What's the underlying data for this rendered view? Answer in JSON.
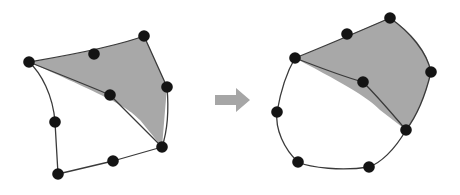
{
  "figure": {
    "title": "Mesh refinement transformation",
    "background_color": "#ffffff",
    "width": 460,
    "height": 195
  },
  "colors": {
    "node_fill": "#141414",
    "edge_stroke": "#3a3a3a",
    "shaded_region_fill": "#a8a8a8",
    "unshaded_region_fill": "#ffffff",
    "arrow_fill": "#a6a6a6"
  },
  "style": {
    "node_radius": 5.8,
    "edge_width": 1.3
  },
  "arrow": {
    "name": "transformation-arrow",
    "direction": "right",
    "path": "M 215 95 L 236 95 L 236 88 L 250 100 L 236 112 L 236 105 L 215 105 Z"
  },
  "panels": [
    {
      "id": "before",
      "label": "before",
      "shaded_region": {
        "label": "shaded-region",
        "fill_path": "M 29 62 C 60 57 110 48 144 36 L 167 87 L 162 147 L 140 120 C 126 106 112 99 29 62 Z"
      },
      "unshaded_region": {
        "label": "unshaded-region",
        "fill_path": "M 29 62 C 70 78 95 88 110 95 L 162 147 L 58 174 L 55 122 C 52 95 40 74 29 62 Z"
      },
      "edges": [
        {
          "name": "edge-top-left",
          "path": "M 29 62 C 58 57 112 48 144 36"
        },
        {
          "name": "edge-top-right",
          "path": "M 144 36 L 167 87"
        },
        {
          "name": "edge-right",
          "path": "M 167 87 C 169 110 167 132 162 147"
        },
        {
          "name": "edge-bottom",
          "path": "M 162 147 L 113 161 L 58 174"
        },
        {
          "name": "edge-left",
          "path": "M 58 174 L 55 122 C 53 95 41 73 29 62"
        },
        {
          "name": "edge-diagonal-interior",
          "path": "M 29 62 C 66 77 94 88 110 95"
        },
        {
          "name": "edge-center-to-bottom-right",
          "path": "M 110 95 L 162 147"
        }
      ],
      "nodes": [
        {
          "name": "node-left",
          "x": 29,
          "y": 62
        },
        {
          "name": "node-top-mid",
          "x": 94,
          "y": 54
        },
        {
          "name": "node-top-right",
          "x": 144,
          "y": 36
        },
        {
          "name": "node-right",
          "x": 167,
          "y": 87
        },
        {
          "name": "node-center",
          "x": 110,
          "y": 95
        },
        {
          "name": "node-left-mid",
          "x": 55,
          "y": 122
        },
        {
          "name": "node-bottom-right",
          "x": 162,
          "y": 147
        },
        {
          "name": "node-bottom-mid",
          "x": 113,
          "y": 161
        },
        {
          "name": "node-bottom-left",
          "x": 58,
          "y": 174
        }
      ]
    },
    {
      "id": "after",
      "label": "after",
      "shaded_region": {
        "label": "shaded-region",
        "fill_path": "M 295 58 C 322 48 360 30 390 18 C 412 32 428 52 431 72 C 426 96 416 116 406 130 L 380 110 C 368 98 352 88 295 58 Z"
      },
      "unshaded_region": {
        "label": "unshaded-region",
        "fill_path": "M 295 58 C 330 72 352 78 363 82 C 377 96 394 116 406 130 C 392 152 378 164 369 167 C 340 170 312 168 298 162 C 284 148 276 128 277 112 C 281 90 288 70 295 58 Z"
      },
      "edges": [
        {
          "name": "edge-top-left",
          "path": "M 295 58 C 320 48 360 31 390 18"
        },
        {
          "name": "edge-top-right",
          "path": "M 390 18 C 410 32 427 52 431 72"
        },
        {
          "name": "edge-right",
          "path": "M 431 72 C 425 97 416 117 406 130"
        },
        {
          "name": "edge-bottom-right",
          "path": "M 406 130 C 394 151 380 163 369 167"
        },
        {
          "name": "edge-bottom",
          "path": "M 369 167 C 342 171 311 168 298 162"
        },
        {
          "name": "edge-bottom-left",
          "path": "M 298 162 C 284 149 275 129 277 112"
        },
        {
          "name": "edge-left",
          "path": "M 277 112 C 281 89 288 70 295 58"
        },
        {
          "name": "edge-diagonal-interior",
          "path": "M 295 58 C 331 72 352 79 363 82"
        },
        {
          "name": "edge-center-to-bottom-right",
          "path": "M 363 82 C 378 97 395 117 406 130"
        }
      ],
      "nodes": [
        {
          "name": "node-left-top",
          "x": 295,
          "y": 58
        },
        {
          "name": "node-top-mid",
          "x": 347,
          "y": 34
        },
        {
          "name": "node-top-right",
          "x": 390,
          "y": 18
        },
        {
          "name": "node-right",
          "x": 431,
          "y": 72
        },
        {
          "name": "node-center",
          "x": 363,
          "y": 82
        },
        {
          "name": "node-left",
          "x": 277,
          "y": 112
        },
        {
          "name": "node-bottom-right",
          "x": 406,
          "y": 130
        },
        {
          "name": "node-bottom-mid",
          "x": 369,
          "y": 167
        },
        {
          "name": "node-bottom-left",
          "x": 298,
          "y": 162
        }
      ]
    }
  ]
}
